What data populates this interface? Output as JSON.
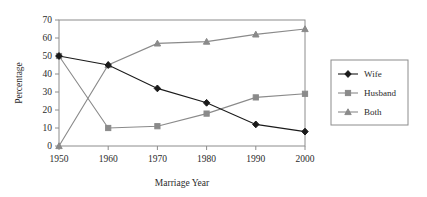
{
  "chart_data": {
    "type": "line",
    "title": "",
    "xlabel": "Marriage Year",
    "ylabel": "Percentage",
    "categories": [
      "1950",
      "1960",
      "1970",
      "1980",
      "1990",
      "2000"
    ],
    "x": [
      1950,
      1960,
      1970,
      1980,
      1990,
      2000
    ],
    "xlim": [
      1950,
      2000
    ],
    "ylim": [
      0,
      70
    ],
    "yticks": [
      "0",
      "10",
      "20",
      "30",
      "40",
      "50",
      "60",
      "70"
    ],
    "ytick_values": [
      0,
      10,
      20,
      30,
      40,
      50,
      60,
      70
    ],
    "grid": false,
    "legend_position": "right",
    "series": [
      {
        "name": "Wife",
        "marker": "diamond",
        "color": "#1a1a1a",
        "values": [
          50,
          45,
          32,
          24,
          12,
          8
        ]
      },
      {
        "name": "Husband",
        "marker": "square",
        "color": "#8a8a8a",
        "values": [
          50,
          10,
          11,
          18,
          27,
          29
        ]
      },
      {
        "name": "Both",
        "marker": "triangle",
        "color": "#8a8a8a",
        "values": [
          0,
          45,
          57,
          58,
          62,
          65
        ]
      }
    ]
  },
  "legend": {
    "entries": [
      "Wife",
      "Husband",
      "Both"
    ]
  },
  "axes": {
    "x_title": "Marriage Year",
    "y_title": "Percentage"
  }
}
